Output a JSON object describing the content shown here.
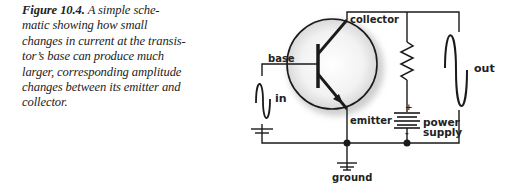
{
  "caption": {
    "label": "Figure 10.4.",
    "lines": [
      " A simple sche-",
      "matic showing how small",
      "changes in current at the transis-",
      "tor’s base can produce much",
      "larger, corresponding amplitude",
      "changes between its emitter and",
      "collector."
    ]
  },
  "schematic": {
    "labels": {
      "collector": "collector",
      "base": "base",
      "emitter": "emitter",
      "input": "in",
      "output": "out",
      "power_line1": "power",
      "power_line2": "supply",
      "ground": "ground",
      "plus": "+",
      "minus": "-"
    },
    "colors": {
      "wire": "#1a1a1a",
      "halo": "#e6e6e6"
    }
  }
}
